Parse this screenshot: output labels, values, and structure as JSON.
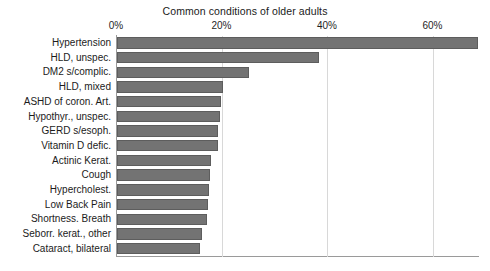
{
  "chart_data": {
    "type": "bar",
    "orientation": "horizontal",
    "title": "Common conditions of older adults",
    "xlabel": "",
    "ylabel": "",
    "xlim": [
      0,
      68.8
    ],
    "xticks": [
      0,
      20,
      40,
      60
    ],
    "xtick_labels": [
      "0%",
      "20%",
      "40%",
      "60%"
    ],
    "grid": "vertical",
    "legend": "none",
    "bar_color": "#737373",
    "bar_edge_color": "#5d5d5d",
    "categories": [
      "Hypertension",
      "HLD, unspec.",
      "DM2 s/complic.",
      "HLD, mixed",
      "ASHD of coron. Art.",
      "Hypothyr., unspec.",
      "GERD s/esoph.",
      "Vitamin D defic.",
      "Actinic Kerat.",
      "Cough",
      "Hypercholest.",
      "Low Back Pain",
      "Shortness. Breath",
      "Seborr. kerat., other",
      "Cataract, bilateral"
    ],
    "values": [
      68.5,
      38.2,
      25.0,
      20.0,
      19.8,
      19.6,
      19.2,
      19.1,
      17.8,
      17.6,
      17.4,
      17.2,
      17.0,
      16.2,
      15.8
    ]
  }
}
